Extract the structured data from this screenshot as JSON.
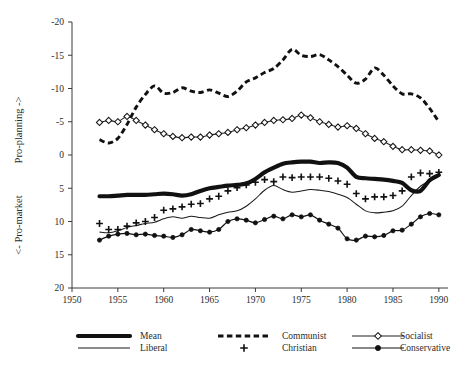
{
  "chart_data": {
    "type": "line",
    "title": "",
    "subtitle": "",
    "xlabel": "",
    "ylabel_upper": "Pro-planning ->",
    "ylabel_lower": "<- Pro-market",
    "xlim": [
      1950,
      1991
    ],
    "ylim": [
      -20,
      20
    ],
    "xticks": [
      1950,
      1955,
      1960,
      1965,
      1970,
      1975,
      1980,
      1985,
      1990
    ],
    "yticks": [
      -20,
      -15,
      -10,
      -5,
      0,
      5,
      10,
      15,
      20
    ],
    "grid": false,
    "legend_position": "below-axes",
    "x": [
      1953,
      1954,
      1955,
      1956,
      1957,
      1958,
      1959,
      1960,
      1961,
      1962,
      1963,
      1964,
      1965,
      1966,
      1967,
      1968,
      1969,
      1970,
      1971,
      1972,
      1973,
      1974,
      1975,
      1976,
      1977,
      1978,
      1979,
      1980,
      1981,
      1982,
      1983,
      1984,
      1985,
      1986,
      1987,
      1988,
      1989,
      1990
    ],
    "series": [
      {
        "name": "Mean",
        "style": "thick-solid",
        "marker": "none",
        "color": "#111111",
        "values": [
          -6.2,
          -6.2,
          -6.1,
          -6.0,
          -6.0,
          -6.0,
          -5.9,
          -5.8,
          -5.9,
          -6.1,
          -5.9,
          -5.4,
          -5.0,
          -4.8,
          -4.6,
          -4.5,
          -4.3,
          -3.6,
          -2.6,
          -1.9,
          -1.3,
          -1.1,
          -1.0,
          -1.0,
          -1.2,
          -1.1,
          -1.2,
          -1.9,
          -3.3,
          -3.5,
          -3.6,
          -3.7,
          -3.9,
          -4.2,
          -5.3,
          -5.4,
          -3.8,
          -3.0
        ]
      },
      {
        "name": "Communist",
        "style": "dashed",
        "marker": "none",
        "color": "#111111",
        "values": [
          2.3,
          1.8,
          2.5,
          4.6,
          7.2,
          9.1,
          10.4,
          9.3,
          9.4,
          10.1,
          9.6,
          9.4,
          9.8,
          9.3,
          8.8,
          9.6,
          11.0,
          11.6,
          12.4,
          13.0,
          14.3,
          15.9,
          15.0,
          14.8,
          15.1,
          14.3,
          13.3,
          12.0,
          10.8,
          11.4,
          13.1,
          12.0,
          10.4,
          9.2,
          9.2,
          8.6,
          7.0,
          5.0
        ]
      },
      {
        "name": "Socialist",
        "style": "thin-solid",
        "marker": "diamond",
        "color": "#222222",
        "values": [
          4.9,
          5.2,
          5.0,
          5.8,
          5.2,
          4.5,
          3.8,
          3.2,
          2.8,
          2.6,
          2.7,
          2.7,
          3.0,
          3.2,
          3.4,
          3.8,
          4.1,
          4.5,
          4.9,
          5.2,
          5.3,
          5.5,
          6.0,
          5.6,
          5.0,
          4.6,
          4.2,
          4.4,
          4.0,
          3.2,
          2.5,
          2.0,
          1.3,
          0.8,
          0.8,
          0.7,
          0.6,
          0.0
        ]
      },
      {
        "name": "Liberal",
        "style": "thin-solid",
        "marker": "none",
        "color": "#1a1a1a",
        "values": [
          -11.6,
          -11.7,
          -11.4,
          -10.9,
          -10.6,
          -10.3,
          -10.1,
          -9.6,
          -9.3,
          -9.5,
          -9.2,
          -9.4,
          -9.5,
          -9.0,
          -8.6,
          -8.4,
          -7.7,
          -6.6,
          -5.3,
          -4.6,
          -5.2,
          -5.6,
          -5.4,
          -5.2,
          -5.3,
          -5.5,
          -5.9,
          -6.4,
          -7.4,
          -8.4,
          -8.7,
          -8.6,
          -8.4,
          -7.7,
          -6.1,
          -4.7,
          -3.9,
          -3.2
        ]
      },
      {
        "name": "Christian",
        "style": "markers-only",
        "marker": "plus",
        "color": "#111111",
        "values": [
          -10.3,
          -11.2,
          -11.2,
          -10.7,
          -10.2,
          -10.0,
          -9.4,
          -8.3,
          -8.1,
          -7.8,
          -7.4,
          -7.3,
          -6.6,
          -6.2,
          -5.4,
          -4.9,
          -4.5,
          -4.1,
          -3.7,
          -4.0,
          -3.3,
          -3.4,
          -3.3,
          -3.3,
          -3.3,
          -3.5,
          -3.9,
          -4.4,
          -5.8,
          -6.6,
          -6.3,
          -6.3,
          -6.1,
          -5.4,
          -3.3,
          -2.7,
          -2.8,
          -2.6
        ]
      },
      {
        "name": "Conservative",
        "style": "thin-solid",
        "marker": "dot",
        "color": "#111111",
        "values": [
          -12.8,
          -12.2,
          -11.9,
          -11.8,
          -12.0,
          -11.9,
          -12.1,
          -12.2,
          -12.4,
          -12.0,
          -11.2,
          -11.4,
          -11.6,
          -11.2,
          -10.0,
          -9.6,
          -9.8,
          -10.2,
          -9.7,
          -9.2,
          -9.6,
          -9.0,
          -9.3,
          -9.0,
          -9.8,
          -10.4,
          -11.0,
          -12.6,
          -12.8,
          -12.2,
          -12.3,
          -12.1,
          -11.4,
          -11.3,
          -10.4,
          -9.3,
          -8.8,
          -9.0
        ]
      }
    ]
  },
  "legend": {
    "items": [
      {
        "label": "Mean",
        "key": "Mean"
      },
      {
        "label": "Communist",
        "key": "Communist"
      },
      {
        "label": "Socialist",
        "key": "Socialist"
      },
      {
        "label": "Liberal",
        "key": "Liberal"
      },
      {
        "label": "Christian",
        "key": "Christian"
      },
      {
        "label": "Conservative",
        "key": "Conservative"
      }
    ]
  },
  "axis": {
    "x_tick_labels": [
      "1950",
      "1955",
      "1960",
      "1965",
      "1970",
      "1975",
      "1980",
      "1985",
      "1990"
    ],
    "y_tick_labels": [
      "20",
      "15",
      "10",
      "5",
      "0",
      "-5",
      "-10",
      "-15",
      "-20"
    ]
  }
}
